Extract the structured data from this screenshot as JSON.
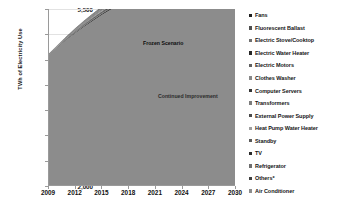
{
  "chart_data": {
    "type": "area",
    "stacked": true,
    "title": "",
    "subtitle": "",
    "xlabel": "",
    "ylabel": "TWh of Electricity Use",
    "x": [
      2009,
      2010,
      2011,
      2012,
      2013,
      2014,
      2015,
      2016,
      2017,
      2018,
      2019,
      2020,
      2021,
      2022,
      2023,
      2024,
      2025,
      2026,
      2027,
      2028,
      2029,
      2030
    ],
    "xlim": [
      2009,
      2030
    ],
    "ylim": [
      2000,
      5500
    ],
    "xticks": [
      2009,
      2012,
      2015,
      2018,
      2021,
      2024,
      2027,
      2030
    ],
    "yticks": [
      2000,
      2500,
      3000,
      3500,
      4000,
      4500,
      5000,
      5500
    ],
    "ytick_labels": [
      "2,000",
      "2,500",
      "3,000",
      "3,500",
      "4,000",
      "4,500",
      "5,000",
      "5,500"
    ],
    "xtick_labels": [
      "2009",
      "2012",
      "2015",
      "2018",
      "2021",
      "2024",
      "2027",
      "2030"
    ],
    "grid": true,
    "legend_position": "right",
    "annotations": [
      {
        "text": "Frozen Scenario",
        "x": 2018,
        "y": 4830
      },
      {
        "text": "Continued Improvement",
        "x": 2021,
        "y": 3900
      }
    ],
    "baseline_label": "Continued Improvement",
    "top_boundary_label": "Frozen Scenario",
    "series": [
      {
        "name": "Air Conditioner",
        "color": "#8c8c8c",
        "values": [
          2580,
          2730,
          2875,
          3010,
          3140,
          3260,
          3375,
          3482,
          3583,
          3678,
          3767,
          3850,
          3928,
          4000,
          4068,
          4131,
          4190,
          4245,
          4296,
          4343,
          4387,
          4428
        ]
      },
      {
        "name": "Others*",
        "color": "#3f3f3f",
        "values": [
          3,
          7,
          11,
          15,
          19,
          23,
          26,
          29,
          32,
          35,
          38,
          41,
          43,
          45,
          47,
          49,
          51,
          53,
          55,
          57,
          59,
          61
        ]
      },
      {
        "name": "Refrigerator",
        "color": "#6e6e6e",
        "values": [
          2,
          5,
          8,
          11,
          14,
          16,
          19,
          21,
          23,
          25,
          27,
          29,
          31,
          33,
          34,
          36,
          37,
          39,
          40,
          41,
          42,
          44
        ]
      },
      {
        "name": "TV",
        "color": "#2a2a2a",
        "values": [
          2,
          4,
          7,
          9,
          12,
          14,
          16,
          18,
          20,
          22,
          24,
          25,
          27,
          28,
          30,
          31,
          33,
          34,
          35,
          36,
          37,
          38
        ]
      },
      {
        "name": "Standby",
        "color": "#5a5a5a",
        "values": [
          2,
          4,
          6,
          9,
          11,
          13,
          15,
          17,
          19,
          20,
          22,
          23,
          25,
          26,
          28,
          29,
          30,
          31,
          32,
          33,
          34,
          35
        ]
      },
      {
        "name": "Heat Pump Water Heater",
        "color": "#9e9e9e",
        "values": [
          1,
          3,
          5,
          7,
          9,
          11,
          12,
          14,
          16,
          17,
          18,
          20,
          21,
          22,
          23,
          24,
          25,
          26,
          27,
          28,
          29,
          30
        ]
      },
      {
        "name": "External Power Supply",
        "color": "#4a4a4a",
        "values": [
          1,
          3,
          5,
          7,
          8,
          10,
          11,
          13,
          14,
          15,
          17,
          18,
          19,
          20,
          21,
          22,
          23,
          24,
          25,
          25,
          26,
          27
        ]
      },
      {
        "name": "Transformers",
        "color": "#7c7c7c",
        "values": [
          1,
          3,
          4,
          6,
          8,
          9,
          11,
          12,
          13,
          14,
          16,
          17,
          18,
          19,
          20,
          20,
          21,
          22,
          23,
          24,
          24,
          25
        ]
      },
      {
        "name": "Computer Servers",
        "color": "#353535",
        "values": [
          1,
          3,
          4,
          6,
          7,
          9,
          10,
          11,
          12,
          14,
          15,
          16,
          17,
          18,
          18,
          19,
          20,
          21,
          21,
          22,
          23,
          23
        ]
      },
      {
        "name": "Clothes Washer",
        "color": "#888888",
        "values": [
          1,
          2,
          4,
          5,
          7,
          8,
          9,
          10,
          12,
          13,
          14,
          15,
          16,
          16,
          17,
          18,
          19,
          19,
          20,
          21,
          21,
          22
        ]
      },
      {
        "name": "Electric Motors",
        "color": "#606060",
        "values": [
          1,
          2,
          4,
          5,
          6,
          8,
          9,
          10,
          11,
          12,
          13,
          14,
          15,
          16,
          16,
          17,
          18,
          18,
          19,
          20,
          20,
          21
        ]
      },
      {
        "name": "Electric Water Heater",
        "color": "#272727",
        "values": [
          1,
          2,
          3,
          5,
          6,
          7,
          8,
          9,
          10,
          11,
          12,
          13,
          14,
          15,
          15,
          16,
          17,
          17,
          18,
          18,
          19,
          19
        ]
      },
      {
        "name": "Electric Stove/Cooktop",
        "color": "#707070",
        "values": [
          1,
          2,
          3,
          4,
          6,
          7,
          8,
          9,
          10,
          11,
          11,
          12,
          13,
          14,
          14,
          15,
          16,
          16,
          17,
          17,
          18,
          18
        ]
      },
      {
        "name": "Fluorescent Ballast",
        "color": "#4f4f4f",
        "values": [
          1,
          2,
          3,
          4,
          5,
          6,
          7,
          8,
          9,
          10,
          11,
          11,
          12,
          13,
          13,
          14,
          15,
          15,
          16,
          16,
          17,
          17
        ]
      },
      {
        "name": "Fans",
        "color": "#1e1e1e",
        "values": [
          1,
          2,
          3,
          4,
          5,
          6,
          7,
          8,
          9,
          9,
          10,
          11,
          12,
          12,
          13,
          13,
          14,
          15,
          15,
          16,
          16,
          17
        ]
      }
    ],
    "series_totals_top": [
      2599,
      2774,
      2945,
      3107,
      3263,
      3407,
      3543,
      3671,
      3793,
      3906,
      4015,
      4115,
      4211,
      4297,
      4377,
      4454,
      4525,
      4591,
      4655,
      4713,
      4767,
      4815
    ]
  },
  "legend": {
    "items": [
      {
        "label": "Fans",
        "color": "#1e1e1e"
      },
      {
        "label": "Fluorescent Ballast",
        "color": "#4f4f4f"
      },
      {
        "label": "Electric Stove/Cooktop",
        "color": "#707070"
      },
      {
        "label": "Electric Water Heater",
        "color": "#272727"
      },
      {
        "label": "Electric Motors",
        "color": "#606060"
      },
      {
        "label": "Clothes Washer",
        "color": "#888888"
      },
      {
        "label": "Computer Servers",
        "color": "#353535"
      },
      {
        "label": "Transformers",
        "color": "#7c7c7c"
      },
      {
        "label": "External Power Supply",
        "color": "#4a4a4a"
      },
      {
        "label": "Heat Pump Water Heater",
        "color": "#9e9e9e"
      },
      {
        "label": "Standby",
        "color": "#5a5a5a"
      },
      {
        "label": "TV",
        "color": "#2a2a2a"
      },
      {
        "label": "Refrigerator",
        "color": "#6e6e6e"
      },
      {
        "label": "Others*",
        "color": "#3f3f3f"
      },
      {
        "label": "Air Conditioner",
        "color": "#8c8c8c"
      }
    ]
  }
}
